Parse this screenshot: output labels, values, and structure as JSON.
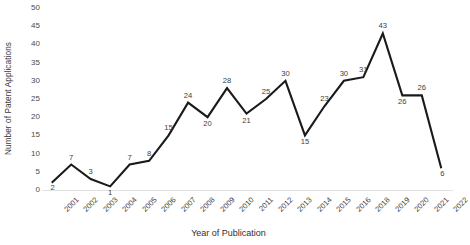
{
  "chart_data": {
    "type": "line",
    "title": "",
    "xlabel": "Year of Publication",
    "ylabel": "Number of Patent Applications",
    "categories": [
      "2001",
      "2002",
      "2003",
      "2004",
      "2005",
      "2006",
      "2007",
      "2008",
      "2009",
      "2010",
      "2011",
      "2012",
      "2013",
      "2014",
      "2015",
      "2016",
      "2018",
      "2019",
      "2020",
      "2021",
      "2022"
    ],
    "values": [
      2,
      7,
      3,
      1,
      7,
      8,
      15,
      24,
      20,
      28,
      21,
      25,
      30,
      15,
      23,
      30,
      31,
      43,
      26,
      26,
      6
    ],
    "ylim": [
      0,
      50
    ],
    "yticks": [
      0,
      5,
      10,
      15,
      20,
      25,
      30,
      35,
      40,
      45,
      50
    ],
    "grid": false,
    "legend": "none",
    "series_color": "#1a1a1a",
    "show_data_labels": true
  }
}
